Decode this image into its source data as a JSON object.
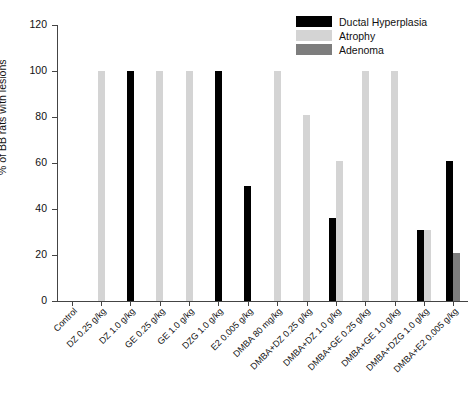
{
  "chart_data": {
    "type": "bar",
    "title": "",
    "xlabel": "",
    "ylabel": "% of BB rats with lesions",
    "ylim": [
      0,
      120
    ],
    "yticks": [
      0,
      20,
      40,
      60,
      80,
      100,
      120
    ],
    "grid": false,
    "legend_position": "top-right",
    "categories": [
      "Control",
      "DZ 0.25 g/kg",
      "DZ 1.0 g/kg",
      "GE 0.25 g/kg",
      "GE 1.0 g/kg",
      "DZG 1.0 g/kg",
      "E2 0.005 g/kg",
      "DMBA 80 mg/kg",
      "DMBA+DZ 0.25 g/kg",
      "DMBA+DZ 1.0 g/kg",
      "DMBA+GE 0.25 g/kg",
      "DMBA+GE 1.0 g/kg",
      "DMBA+DZG 1.0 g/kg",
      "DMBA+E2 0.005 g/kg"
    ],
    "series": [
      {
        "name": "Ductal Hyperplasia",
        "color": "#000000",
        "values": [
          0,
          0,
          100,
          0,
          0,
          100,
          50,
          0,
          0,
          36,
          0,
          0,
          31,
          61
        ]
      },
      {
        "name": "Atrophy",
        "color": "#d4d4d4",
        "values": [
          0,
          100,
          0,
          100,
          100,
          0,
          0,
          100,
          81,
          61,
          100,
          100,
          31,
          0
        ]
      },
      {
        "name": "Adenoma",
        "color": "#7d7d7d",
        "values": [
          0,
          0,
          0,
          0,
          0,
          0,
          0,
          0,
          0,
          0,
          0,
          0,
          0,
          21
        ]
      }
    ]
  },
  "legend": {
    "entries": [
      {
        "label": "Ductal Hyperplasia",
        "color": "#000000",
        "swatch_name": "legend-swatch-ductal-hyperplasia"
      },
      {
        "label": "Atrophy",
        "color": "#d4d4d4",
        "swatch_name": "legend-swatch-atrophy"
      },
      {
        "label": "Adenoma",
        "color": "#7d7d7d",
        "swatch_name": "legend-swatch-adenoma"
      }
    ]
  }
}
